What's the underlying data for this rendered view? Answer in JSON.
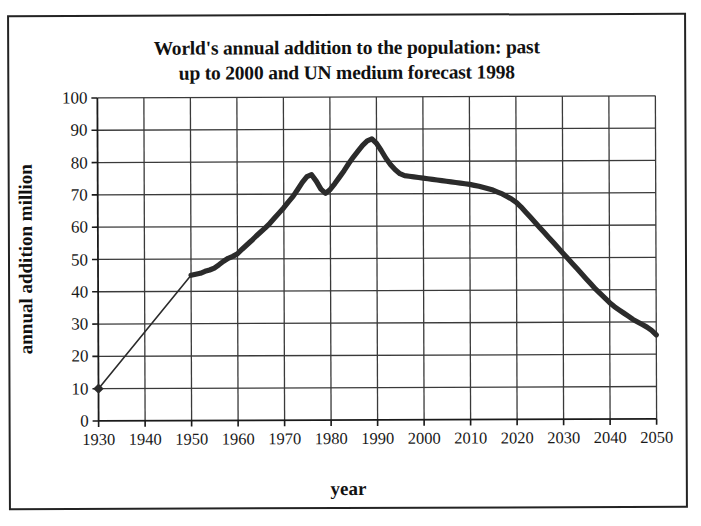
{
  "chart_data": {
    "type": "line",
    "title": "World's annual addition to the population: past up to 2000 and UN medium forecast 1998",
    "title_line1": "World's annual addition to the population: past",
    "title_line2": "up to 2000 and UN medium forecast 1998",
    "xlabel": "year",
    "ylabel": "annual addition million",
    "xlim": [
      1930,
      2050
    ],
    "ylim": [
      0,
      100
    ],
    "grid": true,
    "legend": "none",
    "xticks": [
      1930,
      1940,
      1950,
      1960,
      1970,
      1980,
      1990,
      2000,
      2010,
      2020,
      2030,
      2040,
      2050
    ],
    "yticks": [
      0,
      10,
      20,
      30,
      40,
      50,
      60,
      70,
      80,
      90,
      100
    ],
    "series": [
      {
        "name": "annual addition (interpolated 1930-1950)",
        "style": "thin-line-with-diamond-marker",
        "x": [
          1930,
          1950
        ],
        "values": [
          10,
          45
        ]
      },
      {
        "name": "annual addition (observed 1950-2000 and UN medium forecast 1998 to 2050)",
        "style": "thick-line",
        "x": [
          1950,
          1951,
          1952,
          1953,
          1954,
          1955,
          1956,
          1957,
          1958,
          1959,
          1960,
          1961,
          1962,
          1963,
          1964,
          1965,
          1966,
          1967,
          1968,
          1969,
          1970,
          1971,
          1972,
          1973,
          1974,
          1975,
          1976,
          1977,
          1978,
          1979,
          1980,
          1981,
          1982,
          1983,
          1984,
          1985,
          1986,
          1987,
          1988,
          1989,
          1990,
          1991,
          1992,
          1993,
          1994,
          1995,
          1996,
          1997,
          1998,
          1999,
          2000,
          2001,
          2002,
          2003,
          2004,
          2005,
          2006,
          2007,
          2008,
          2009,
          2010,
          2011,
          2012,
          2013,
          2014,
          2015,
          2016,
          2017,
          2018,
          2019,
          2020,
          2021,
          2022,
          2023,
          2024,
          2025,
          2026,
          2027,
          2028,
          2029,
          2030,
          2031,
          2032,
          2033,
          2034,
          2035,
          2036,
          2037,
          2038,
          2039,
          2040,
          2041,
          2042,
          2043,
          2044,
          2045,
          2046,
          2047,
          2048,
          2049,
          2050
        ],
        "values": [
          45,
          45.3,
          45.6,
          46.2,
          46.6,
          47.2,
          48.2,
          49.3,
          50.2,
          50.8,
          51.6,
          53.0,
          54.3,
          55.6,
          57.0,
          58.3,
          59.6,
          61.0,
          62.6,
          64.2,
          65.8,
          67.6,
          69.3,
          71.4,
          73.6,
          75.4,
          76.0,
          74.0,
          71.5,
          70.2,
          71.4,
          73.2,
          75.2,
          77.2,
          79.4,
          81.4,
          83.2,
          85.0,
          86.4,
          87.0,
          85.6,
          83.4,
          81.0,
          79.0,
          77.4,
          76.2,
          75.6,
          75.4,
          75.2,
          75.0,
          74.8,
          74.6,
          74.4,
          74.2,
          74.0,
          73.8,
          73.6,
          73.4,
          73.2,
          73.0,
          72.8,
          72.5,
          72.2,
          71.8,
          71.4,
          71.0,
          70.4,
          69.8,
          69.0,
          68.2,
          67.2,
          65.8,
          64.2,
          62.6,
          61.0,
          59.4,
          57.8,
          56.2,
          54.6,
          53.0,
          51.4,
          49.8,
          48.2,
          46.6,
          45.0,
          43.4,
          41.8,
          40.2,
          38.8,
          37.4,
          36.0,
          34.8,
          33.8,
          32.8,
          31.8,
          30.8,
          30.0,
          29.2,
          28.4,
          27.4,
          26.0
        ]
      }
    ],
    "annotations": {
      "start_marker_year": 1930,
      "start_marker_value": 10,
      "peak_year": 1989,
      "peak_value": 87,
      "local_peak_year": 1976,
      "local_peak_value": 76,
      "local_trough_year": 1978,
      "local_trough_value": 70,
      "end_year": 2050,
      "end_value": 26
    },
    "colors": {
      "line": "#2b2b2b",
      "grid": "#3a3a3a",
      "axis": "#1a1a1a",
      "background": "#ffffff",
      "text": "#111111"
    }
  }
}
